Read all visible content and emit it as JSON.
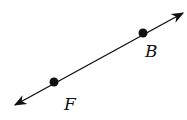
{
  "diagram": {
    "type": "line",
    "line": {
      "x1": 15,
      "y1": 105,
      "x2": 183,
      "y2": 13,
      "arrows": "both",
      "color": "#111111"
    },
    "points": [
      {
        "label": "F",
        "x": 54,
        "y": 82,
        "label_x": 64,
        "label_y": 110
      },
      {
        "label": "B",
        "x": 143,
        "y": 33,
        "label_x": 145,
        "label_y": 57
      }
    ]
  }
}
